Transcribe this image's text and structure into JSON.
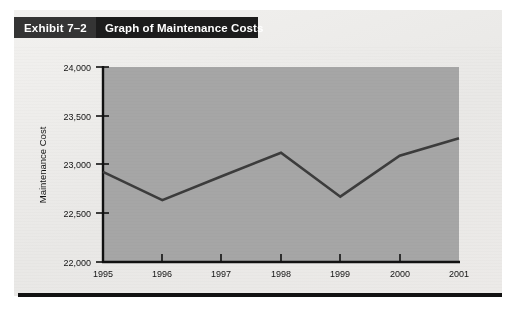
{
  "header": {
    "exhibit_label": "Exhibit 7–2",
    "title": "Graph of Maintenance Costs",
    "bar_color": "#1c1c1c",
    "label_block_color": "#343434",
    "text_color": "#ffffff"
  },
  "chart_data": {
    "type": "line",
    "title": "Graph of Maintenance Costs",
    "xlabel": "",
    "ylabel": "Maintenance Cost",
    "categories": [
      "1995",
      "1996",
      "1997",
      "1998",
      "1999",
      "2000",
      "2001"
    ],
    "values": [
      22925,
      22635,
      22880,
      23120,
      22670,
      23090,
      23270
    ],
    "series": [
      {
        "name": "Maintenance Cost",
        "values": [
          22925,
          22635,
          22880,
          23120,
          22670,
          23090,
          23270
        ]
      }
    ],
    "ylim": [
      22000,
      24000
    ],
    "yticks": [
      22000,
      22500,
      23000,
      23500,
      24000
    ],
    "ytick_labels": [
      "22,000",
      "22,500",
      "23,000",
      "23,500",
      "24,000"
    ],
    "xtick_labels": [
      "1995",
      "1996",
      "1997",
      "1998",
      "1999",
      "2000",
      "2001"
    ],
    "grid": false,
    "legend": "none",
    "plot_background": "#a6a6a6",
    "line_color": "#3c3c3c",
    "axis_color": "#111111"
  },
  "axis": {
    "y_label": "Maintenance Cost",
    "y_ticks": {
      "t0": "22,000",
      "t1": "22,500",
      "t2": "23,000",
      "t3": "23,500",
      "t4": "24,000"
    },
    "x_ticks": {
      "t0": "1995",
      "t1": "1996",
      "t2": "1997",
      "t3": "1998",
      "t4": "1999",
      "t5": "2000",
      "t6": "2001"
    }
  },
  "page": {
    "background": "#ecebe9",
    "rule_color": "#111111"
  }
}
